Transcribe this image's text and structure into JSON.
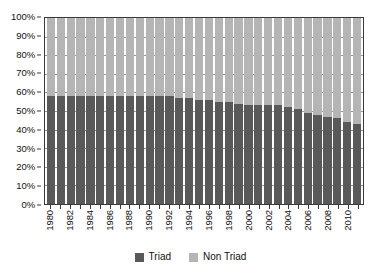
{
  "chart_data": {
    "type": "bar",
    "subtype": "stacked-100-percent",
    "title": "",
    "subtitle": "",
    "xlabel": "",
    "ylabel": "",
    "ylim": [
      0,
      100
    ],
    "ytick_values": [
      0,
      10,
      20,
      30,
      40,
      50,
      60,
      70,
      80,
      90,
      100
    ],
    "ytick_labels": [
      "0%",
      "10%",
      "20%",
      "30%",
      "40%",
      "50%",
      "60%",
      "70%",
      "80%",
      "90%",
      "100%"
    ],
    "grid": true,
    "legend_position": "bottom-center",
    "categories": [
      "1980",
      "1981",
      "1982",
      "1983",
      "1984",
      "1985",
      "1986",
      "1987",
      "1988",
      "1989",
      "1990",
      "1991",
      "1992",
      "1993",
      "1994",
      "1995",
      "1996",
      "1997",
      "1998",
      "1999",
      "2000",
      "2001",
      "2002",
      "2003",
      "2004",
      "2005",
      "2006",
      "2007",
      "2008",
      "2009",
      "2010",
      "2011"
    ],
    "xtick_labels": [
      "1980",
      "",
      "1982",
      "",
      "1984",
      "",
      "1986",
      "",
      "1988",
      "",
      "1990",
      "",
      "1992",
      "",
      "1994",
      "",
      "1996",
      "",
      "1998",
      "",
      "2000",
      "",
      "2002",
      "",
      "2004",
      "",
      "2006",
      "",
      "2008",
      "",
      "2010",
      ""
    ],
    "series": [
      {
        "name": "Triad",
        "color": "#595959",
        "values": [
          58,
          58,
          58,
          58,
          58,
          58,
          58,
          58,
          58,
          58,
          58,
          58,
          58,
          57,
          57,
          56,
          56,
          55,
          55,
          54,
          53,
          53,
          53,
          53,
          52,
          51,
          49,
          48,
          47,
          46,
          44,
          43
        ]
      },
      {
        "name": "Non Triad",
        "color": "#b5b5b5",
        "values": [
          42,
          42,
          42,
          42,
          42,
          42,
          42,
          42,
          42,
          42,
          42,
          42,
          42,
          43,
          43,
          44,
          44,
          45,
          45,
          46,
          47,
          47,
          47,
          47,
          48,
          49,
          51,
          52,
          53,
          54,
          56,
          57
        ]
      }
    ]
  },
  "legend": {
    "items": [
      {
        "label": "Triad",
        "color": "#595959"
      },
      {
        "label": "Non Triad",
        "color": "#b5b5b5"
      }
    ]
  }
}
